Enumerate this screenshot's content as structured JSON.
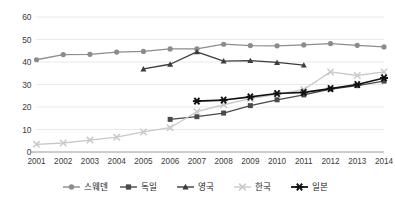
{
  "chart_data": {
    "type": "line",
    "title": "",
    "subtitle": "",
    "xlabel": "",
    "ylabel": "",
    "grid": true,
    "legend_position": "bottom",
    "categories": [
      "2001",
      "2002",
      "2003",
      "2004",
      "2005",
      "2006",
      "2007",
      "2008",
      "2009",
      "2010",
      "2011",
      "2012",
      "2013",
      "2014"
    ],
    "x": [
      2001,
      2002,
      2003,
      2004,
      2005,
      2006,
      2007,
      2008,
      2009,
      2010,
      2011,
      2012,
      2013,
      2014
    ],
    "ylim": [
      0,
      60
    ],
    "yticks": [
      0,
      10,
      20,
      30,
      40,
      50,
      60
    ],
    "xlim": [
      2001,
      2014
    ],
    "series": [
      {
        "name": "스웨덴",
        "marker": "circle",
        "color": "#8c8c8c",
        "values": [
          41.0,
          43.3,
          43.4,
          44.4,
          44.7,
          45.8,
          45.8,
          47.9,
          47.3,
          47.2,
          47.6,
          48.2,
          47.4,
          46.7
        ]
      },
      {
        "name": "독일",
        "marker": "square",
        "color": "#4a4a4a",
        "values": [
          null,
          null,
          null,
          null,
          null,
          14.5,
          15.7,
          17.3,
          20.6,
          23.2,
          25.4,
          28.0,
          29.5,
          31.5
        ]
      },
      {
        "name": "영국",
        "marker": "triangle",
        "color": "#3d3d3d",
        "values": [
          null,
          null,
          null,
          null,
          36.9,
          39.0,
          44.5,
          40.4,
          40.6,
          39.8,
          38.6,
          null,
          null,
          null
        ]
      },
      {
        "name": "한국",
        "marker": "x",
        "color": "#c9c9c9",
        "values": [
          3.4,
          4.0,
          5.3,
          6.6,
          8.9,
          10.8,
          17.9,
          21.0,
          23.7,
          25.6,
          27.8,
          35.6,
          34.0,
          35.6
        ]
      },
      {
        "name": "일본",
        "marker": "asterisk",
        "color": "#111111",
        "values": [
          null,
          null,
          null,
          null,
          null,
          null,
          22.6,
          23.1,
          24.5,
          26.0,
          26.5,
          28.2,
          30.0,
          32.9
        ]
      }
    ],
    "ytick_labels": [
      "0",
      "10",
      "20",
      "30",
      "40",
      "50",
      "60"
    ],
    "xtick_labels": [
      "2001",
      "2002",
      "2003",
      "2004",
      "2005",
      "2006",
      "2007",
      "2008",
      "2009",
      "2010",
      "2011",
      "2012",
      "2013",
      "2014"
    ],
    "legend_entries": [
      "스웨덴",
      "독일",
      "영국",
      "한국",
      "일본"
    ]
  }
}
